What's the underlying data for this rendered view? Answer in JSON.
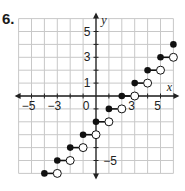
{
  "problem": {
    "number": "6."
  },
  "chart_data": {
    "type": "line",
    "subtype": "step_function",
    "title": "",
    "xlabel": "x",
    "ylabel": "y",
    "xlim": [
      -6,
      6
    ],
    "ylim": [
      -6,
      6
    ],
    "grid": true,
    "x_tick_labels": [
      "-5",
      "-3",
      "0",
      "3",
      "5"
    ],
    "y_tick_labels": [
      "5",
      "3",
      "1",
      "-5"
    ],
    "function": "y = floor(x) - 2",
    "segments": [
      {
        "x_start": -4,
        "x_end": -3,
        "y": -6,
        "start": "closed",
        "end": "open"
      },
      {
        "x_start": -3,
        "x_end": -2,
        "y": -5,
        "start": "closed",
        "end": "open"
      },
      {
        "x_start": -2,
        "x_end": -1,
        "y": -4,
        "start": "closed",
        "end": "open"
      },
      {
        "x_start": -1,
        "x_end": 0,
        "y": -3,
        "start": "closed",
        "end": "open"
      },
      {
        "x_start": 0,
        "x_end": 1,
        "y": -2,
        "start": "closed",
        "end": "open"
      },
      {
        "x_start": 1,
        "x_end": 2,
        "y": -1,
        "start": "closed",
        "end": "open"
      },
      {
        "x_start": 2,
        "x_end": 3,
        "y": 0,
        "start": "closed",
        "end": "open"
      },
      {
        "x_start": 3,
        "x_end": 4,
        "y": 1,
        "start": "closed",
        "end": "open"
      },
      {
        "x_start": 4,
        "x_end": 5,
        "y": 2,
        "start": "closed",
        "end": "open"
      },
      {
        "x_start": 5,
        "x_end": 6,
        "y": 3,
        "start": "closed",
        "end": "open"
      },
      {
        "x_start": 6,
        "x_end": 6,
        "y": 4,
        "start": "closed",
        "end": "none"
      }
    ]
  },
  "colors": {
    "grid": "#c8c8c8",
    "axis": "#222222",
    "curve": "#111111"
  }
}
